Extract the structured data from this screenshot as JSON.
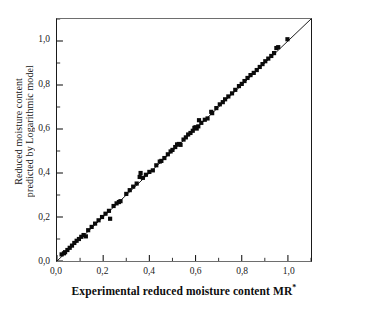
{
  "chart_data": {
    "type": "scatter",
    "title": "",
    "xlabel": "Experimental reduced moisture content MR",
    "xlabel_superscript": "*",
    "ylabel_line1": "Reduced moisture content",
    "ylabel_line2": "predicted by Logarithmic model",
    "xlim": [
      0.0,
      1.1
    ],
    "ylim": [
      0.0,
      1.1
    ],
    "xticks": [
      0.0,
      0.2,
      0.4,
      0.6,
      0.8,
      1.0
    ],
    "yticks": [
      0.0,
      0.2,
      0.4,
      0.6,
      0.8,
      1.0
    ],
    "xtick_labels": [
      "0,0",
      "0,2",
      "0,4",
      "0,6",
      "0,8",
      "1,0"
    ],
    "ytick_labels": [
      "0,0",
      "0,2",
      "0,4",
      "0,6",
      "0,8",
      "1,0"
    ],
    "minor_ticks": true,
    "grid": false,
    "legend": "none",
    "marker": "filled-square",
    "marker_color": "#0a0a0a",
    "line_color": "#1a1a1a",
    "reference_line": {
      "label": "y = x identity line",
      "x": [
        0.0,
        1.1
      ],
      "y": [
        0.0,
        1.1
      ]
    },
    "series": [
      {
        "name": "Logarithmic model predicted vs experimental",
        "points": [
          [
            0.02,
            0.03
          ],
          [
            0.03,
            0.035
          ],
          [
            0.035,
            0.04
          ],
          [
            0.045,
            0.05
          ],
          [
            0.055,
            0.06
          ],
          [
            0.065,
            0.07
          ],
          [
            0.075,
            0.082
          ],
          [
            0.085,
            0.092
          ],
          [
            0.095,
            0.1
          ],
          [
            0.105,
            0.11
          ],
          [
            0.115,
            0.118
          ],
          [
            0.125,
            0.112
          ],
          [
            0.135,
            0.14
          ],
          [
            0.15,
            0.155
          ],
          [
            0.165,
            0.17
          ],
          [
            0.18,
            0.185
          ],
          [
            0.195,
            0.2
          ],
          [
            0.21,
            0.215
          ],
          [
            0.225,
            0.228
          ],
          [
            0.23,
            0.192
          ],
          [
            0.245,
            0.25
          ],
          [
            0.258,
            0.262
          ],
          [
            0.268,
            0.268
          ],
          [
            0.275,
            0.272
          ],
          [
            0.3,
            0.305
          ],
          [
            0.315,
            0.322
          ],
          [
            0.33,
            0.338
          ],
          [
            0.345,
            0.352
          ],
          [
            0.358,
            0.382
          ],
          [
            0.362,
            0.4
          ],
          [
            0.372,
            0.378
          ],
          [
            0.385,
            0.392
          ],
          [
            0.4,
            0.405
          ],
          [
            0.415,
            0.412
          ],
          [
            0.43,
            0.435
          ],
          [
            0.445,
            0.452
          ],
          [
            0.452,
            0.455
          ],
          [
            0.465,
            0.468
          ],
          [
            0.48,
            0.485
          ],
          [
            0.492,
            0.498
          ],
          [
            0.5,
            0.505
          ],
          [
            0.512,
            0.518
          ],
          [
            0.52,
            0.53
          ],
          [
            0.528,
            0.532
          ],
          [
            0.535,
            0.528
          ],
          [
            0.548,
            0.552
          ],
          [
            0.558,
            0.562
          ],
          [
            0.568,
            0.575
          ],
          [
            0.578,
            0.582
          ],
          [
            0.588,
            0.592
          ],
          [
            0.595,
            0.605
          ],
          [
            0.6,
            0.608
          ],
          [
            0.605,
            0.602
          ],
          [
            0.612,
            0.612
          ],
          [
            0.615,
            0.64
          ],
          [
            0.625,
            0.628
          ],
          [
            0.64,
            0.642
          ],
          [
            0.652,
            0.648
          ],
          [
            0.668,
            0.678
          ],
          [
            0.672,
            0.672
          ],
          [
            0.69,
            0.695
          ],
          [
            0.705,
            0.712
          ],
          [
            0.718,
            0.722
          ],
          [
            0.728,
            0.735
          ],
          [
            0.742,
            0.748
          ],
          [
            0.758,
            0.762
          ],
          [
            0.772,
            0.778
          ],
          [
            0.788,
            0.795
          ],
          [
            0.8,
            0.805
          ],
          [
            0.812,
            0.818
          ],
          [
            0.825,
            0.832
          ],
          [
            0.838,
            0.845
          ],
          [
            0.852,
            0.855
          ],
          [
            0.865,
            0.868
          ],
          [
            0.878,
            0.882
          ],
          [
            0.89,
            0.895
          ],
          [
            0.902,
            0.908
          ],
          [
            0.915,
            0.92
          ],
          [
            0.928,
            0.932
          ],
          [
            0.94,
            0.945
          ],
          [
            0.95,
            0.968
          ],
          [
            0.958,
            0.972
          ],
          [
            0.998,
            1.008
          ]
        ]
      }
    ]
  }
}
